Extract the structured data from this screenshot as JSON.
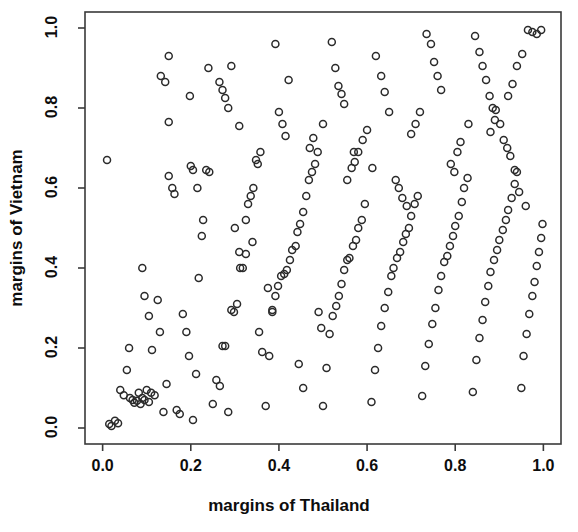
{
  "chart_data": {
    "type": "scatter",
    "title": "",
    "xlabel": "margins of Thailand",
    "ylabel": "margins of Vietnam",
    "xlim": [
      -0.04,
      1.04
    ],
    "ylim": [
      -0.04,
      1.04
    ],
    "xticks": [
      0.0,
      0.2,
      0.4,
      0.6,
      0.8,
      1.0
    ],
    "yticks": [
      0.0,
      0.2,
      0.4,
      0.6,
      0.8,
      1.0
    ],
    "xtick_labels": [
      "0.0",
      "0.2",
      "0.4",
      "0.6",
      "0.8",
      "1.0"
    ],
    "ytick_labels": [
      "0.0",
      "0.2",
      "0.4",
      "0.6",
      "0.8",
      "1.0"
    ],
    "grid": false,
    "legend": false,
    "marker": "open-circle",
    "marker_size": 7,
    "marker_color": "#2b2b2b",
    "frame": true,
    "n_points": 231,
    "points": [
      [
        0.015,
        0.01
      ],
      [
        0.02,
        0.005
      ],
      [
        0.028,
        0.018
      ],
      [
        0.035,
        0.012
      ],
      [
        0.01,
        0.67
      ],
      [
        0.04,
        0.095
      ],
      [
        0.048,
        0.082
      ],
      [
        0.055,
        0.145
      ],
      [
        0.062,
        0.075
      ],
      [
        0.068,
        0.07
      ],
      [
        0.072,
        0.063
      ],
      [
        0.078,
        0.068
      ],
      [
        0.082,
        0.088
      ],
      [
        0.086,
        0.06
      ],
      [
        0.09,
        0.075
      ],
      [
        0.095,
        0.07
      ],
      [
        0.1,
        0.095
      ],
      [
        0.105,
        0.065
      ],
      [
        0.11,
        0.088
      ],
      [
        0.118,
        0.082
      ],
      [
        0.125,
        0.32
      ],
      [
        0.13,
        0.24
      ],
      [
        0.138,
        0.04
      ],
      [
        0.145,
        0.11
      ],
      [
        0.15,
        0.63
      ],
      [
        0.158,
        0.6
      ],
      [
        0.163,
        0.585
      ],
      [
        0.15,
        0.93
      ],
      [
        0.132,
        0.88
      ],
      [
        0.142,
        0.865
      ],
      [
        0.168,
        0.045
      ],
      [
        0.175,
        0.035
      ],
      [
        0.182,
        0.285
      ],
      [
        0.19,
        0.24
      ],
      [
        0.196,
        0.18
      ],
      [
        0.205,
        0.02
      ],
      [
        0.212,
        0.135
      ],
      [
        0.218,
        0.375
      ],
      [
        0.225,
        0.48
      ],
      [
        0.228,
        0.52
      ],
      [
        0.235,
        0.645
      ],
      [
        0.242,
        0.64
      ],
      [
        0.198,
        0.83
      ],
      [
        0.15,
        0.765
      ],
      [
        0.25,
        0.06
      ],
      [
        0.258,
        0.12
      ],
      [
        0.266,
        0.105
      ],
      [
        0.272,
        0.205
      ],
      [
        0.278,
        0.205
      ],
      [
        0.285,
        0.04
      ],
      [
        0.292,
        0.295
      ],
      [
        0.298,
        0.29
      ],
      [
        0.305,
        0.31
      ],
      [
        0.312,
        0.4
      ],
      [
        0.318,
        0.4
      ],
      [
        0.325,
        0.435
      ],
      [
        0.33,
        0.56
      ],
      [
        0.336,
        0.58
      ],
      [
        0.342,
        0.6
      ],
      [
        0.348,
        0.67
      ],
      [
        0.352,
        0.66
      ],
      [
        0.358,
        0.69
      ],
      [
        0.265,
        0.865
      ],
      [
        0.272,
        0.845
      ],
      [
        0.278,
        0.825
      ],
      [
        0.285,
        0.8
      ],
      [
        0.292,
        0.905
      ],
      [
        0.24,
        0.9
      ],
      [
        0.31,
        0.755
      ],
      [
        0.325,
        0.52
      ],
      [
        0.34,
        0.465
      ],
      [
        0.355,
        0.24
      ],
      [
        0.362,
        0.19
      ],
      [
        0.37,
        0.055
      ],
      [
        0.378,
        0.18
      ],
      [
        0.385,
        0.295
      ],
      [
        0.392,
        0.33
      ],
      [
        0.398,
        0.355
      ],
      [
        0.405,
        0.38
      ],
      [
        0.412,
        0.385
      ],
      [
        0.418,
        0.395
      ],
      [
        0.425,
        0.42
      ],
      [
        0.43,
        0.445
      ],
      [
        0.438,
        0.455
      ],
      [
        0.442,
        0.49
      ],
      [
        0.448,
        0.51
      ],
      [
        0.455,
        0.54
      ],
      [
        0.462,
        0.58
      ],
      [
        0.468,
        0.62
      ],
      [
        0.475,
        0.64
      ],
      [
        0.482,
        0.66
      ],
      [
        0.488,
        0.69
      ],
      [
        0.392,
        0.96
      ],
      [
        0.4,
        0.79
      ],
      [
        0.408,
        0.76
      ],
      [
        0.415,
        0.73
      ],
      [
        0.422,
        0.87
      ],
      [
        0.5,
        0.055
      ],
      [
        0.508,
        0.15
      ],
      [
        0.515,
        0.235
      ],
      [
        0.522,
        0.28
      ],
      [
        0.53,
        0.305
      ],
      [
        0.536,
        0.33
      ],
      [
        0.542,
        0.36
      ],
      [
        0.548,
        0.395
      ],
      [
        0.555,
        0.42
      ],
      [
        0.56,
        0.425
      ],
      [
        0.568,
        0.455
      ],
      [
        0.575,
        0.47
      ],
      [
        0.58,
        0.5
      ],
      [
        0.588,
        0.52
      ],
      [
        0.595,
        0.56
      ],
      [
        0.52,
        0.965
      ],
      [
        0.528,
        0.9
      ],
      [
        0.535,
        0.855
      ],
      [
        0.542,
        0.835
      ],
      [
        0.548,
        0.81
      ],
      [
        0.5,
        0.76
      ],
      [
        0.478,
        0.725
      ],
      [
        0.47,
        0.7
      ],
      [
        0.61,
        0.065
      ],
      [
        0.618,
        0.145
      ],
      [
        0.625,
        0.2
      ],
      [
        0.632,
        0.255
      ],
      [
        0.64,
        0.3
      ],
      [
        0.648,
        0.34
      ],
      [
        0.655,
        0.38
      ],
      [
        0.66,
        0.4
      ],
      [
        0.668,
        0.425
      ],
      [
        0.675,
        0.44
      ],
      [
        0.682,
        0.465
      ],
      [
        0.688,
        0.485
      ],
      [
        0.695,
        0.5
      ],
      [
        0.7,
        0.53
      ],
      [
        0.708,
        0.56
      ],
      [
        0.715,
        0.58
      ],
      [
        0.62,
        0.93
      ],
      [
        0.632,
        0.88
      ],
      [
        0.64,
        0.84
      ],
      [
        0.65,
        0.79
      ],
      [
        0.6,
        0.745
      ],
      [
        0.59,
        0.72
      ],
      [
        0.58,
        0.69
      ],
      [
        0.572,
        0.665
      ],
      [
        0.725,
        0.08
      ],
      [
        0.732,
        0.155
      ],
      [
        0.74,
        0.21
      ],
      [
        0.748,
        0.26
      ],
      [
        0.755,
        0.3
      ],
      [
        0.762,
        0.345
      ],
      [
        0.768,
        0.38
      ],
      [
        0.775,
        0.415
      ],
      [
        0.782,
        0.43
      ],
      [
        0.788,
        0.455
      ],
      [
        0.795,
        0.48
      ],
      [
        0.8,
        0.505
      ],
      [
        0.808,
        0.53
      ],
      [
        0.815,
        0.565
      ],
      [
        0.82,
        0.6
      ],
      [
        0.828,
        0.625
      ],
      [
        0.735,
        0.985
      ],
      [
        0.745,
        0.96
      ],
      [
        0.752,
        0.915
      ],
      [
        0.76,
        0.88
      ],
      [
        0.768,
        0.845
      ],
      [
        0.72,
        0.79
      ],
      [
        0.71,
        0.76
      ],
      [
        0.7,
        0.735
      ],
      [
        0.84,
        0.09
      ],
      [
        0.848,
        0.17
      ],
      [
        0.855,
        0.225
      ],
      [
        0.862,
        0.27
      ],
      [
        0.868,
        0.315
      ],
      [
        0.875,
        0.355
      ],
      [
        0.88,
        0.39
      ],
      [
        0.888,
        0.42
      ],
      [
        0.895,
        0.445
      ],
      [
        0.9,
        0.47
      ],
      [
        0.908,
        0.495
      ],
      [
        0.915,
        0.52
      ],
      [
        0.92,
        0.545
      ],
      [
        0.928,
        0.575
      ],
      [
        0.935,
        0.61
      ],
      [
        0.94,
        0.64
      ],
      [
        0.845,
        0.98
      ],
      [
        0.855,
        0.94
      ],
      [
        0.862,
        0.905
      ],
      [
        0.87,
        0.87
      ],
      [
        0.878,
        0.83
      ],
      [
        0.885,
        0.8
      ],
      [
        0.892,
        0.795
      ],
      [
        0.83,
        0.76
      ],
      [
        0.95,
        0.1
      ],
      [
        0.955,
        0.18
      ],
      [
        0.962,
        0.235
      ],
      [
        0.968,
        0.285
      ],
      [
        0.975,
        0.33
      ],
      [
        0.98,
        0.365
      ],
      [
        0.985,
        0.405
      ],
      [
        0.99,
        0.44
      ],
      [
        0.995,
        0.475
      ],
      [
        0.998,
        0.51
      ],
      [
        0.96,
        0.555
      ],
      [
        0.945,
        0.59
      ],
      [
        0.935,
        0.645
      ],
      [
        0.925,
        0.68
      ],
      [
        0.918,
        0.7
      ],
      [
        0.91,
        0.72
      ],
      [
        0.965,
        0.995
      ],
      [
        0.975,
        0.99
      ],
      [
        0.985,
        0.985
      ],
      [
        0.995,
        0.995
      ],
      [
        0.952,
        0.935
      ],
      [
        0.94,
        0.905
      ],
      [
        0.93,
        0.86
      ],
      [
        0.92,
        0.83
      ],
      [
        0.09,
        0.4
      ],
      [
        0.095,
        0.33
      ],
      [
        0.105,
        0.28
      ],
      [
        0.112,
        0.195
      ],
      [
        0.06,
        0.2
      ],
      [
        0.2,
        0.655
      ],
      [
        0.205,
        0.645
      ],
      [
        0.215,
        0.6
      ],
      [
        0.3,
        0.5
      ],
      [
        0.31,
        0.44
      ],
      [
        0.375,
        0.35
      ],
      [
        0.385,
        0.29
      ],
      [
        0.445,
        0.16
      ],
      [
        0.455,
        0.1
      ],
      [
        0.49,
        0.29
      ],
      [
        0.496,
        0.25
      ],
      [
        0.555,
        0.62
      ],
      [
        0.565,
        0.65
      ],
      [
        0.57,
        0.69
      ],
      [
        0.612,
        0.65
      ],
      [
        0.665,
        0.62
      ],
      [
        0.672,
        0.6
      ],
      [
        0.68,
        0.575
      ],
      [
        0.69,
        0.555
      ],
      [
        0.79,
        0.66
      ],
      [
        0.798,
        0.64
      ],
      [
        0.805,
        0.69
      ],
      [
        0.812,
        0.715
      ],
      [
        0.88,
        0.74
      ],
      [
        0.89,
        0.77
      ],
      [
        0.902,
        0.76
      ]
    ]
  }
}
